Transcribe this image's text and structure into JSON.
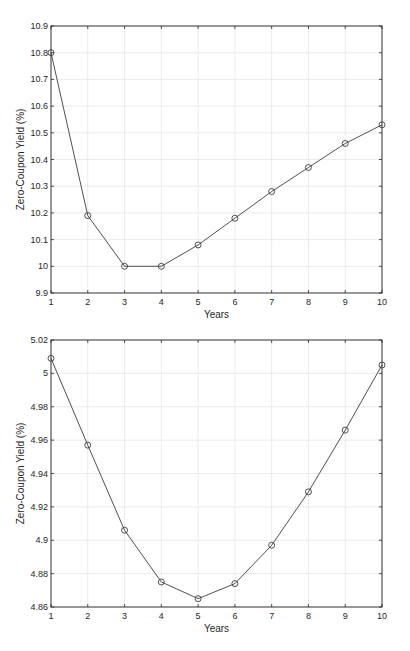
{
  "chart_data": [
    {
      "type": "line",
      "title": "",
      "xlabel": "Years",
      "ylabel": "Zero-Coupon Yield (%)",
      "x": [
        1,
        2,
        3,
        4,
        5,
        6,
        7,
        8,
        9,
        10
      ],
      "series": [
        {
          "name": "Zero-Coupon Yield",
          "values": [
            10.8,
            10.19,
            10.0,
            10.0,
            10.08,
            10.18,
            10.28,
            10.37,
            10.46,
            10.53
          ],
          "marker": "circle",
          "color": "#3c3c3c"
        }
      ],
      "xlim": [
        1,
        10
      ],
      "ylim": [
        9.9,
        10.9
      ],
      "xticks": [
        "1",
        "2",
        "3",
        "4",
        "5",
        "6",
        "7",
        "8",
        "9",
        "10"
      ],
      "yticks": [
        "9.9",
        "10",
        "10.1",
        "10.2",
        "10.3",
        "10.4",
        "10.5",
        "10.6",
        "10.7",
        "10.8",
        "10.9"
      ],
      "grid": true,
      "legend": "none"
    },
    {
      "type": "line",
      "title": "",
      "xlabel": "Years",
      "ylabel": "Zero-Coupon Yield (%)",
      "x": [
        1,
        2,
        3,
        4,
        5,
        6,
        7,
        8,
        9,
        10
      ],
      "series": [
        {
          "name": "Zero-Coupon Yield",
          "values": [
            5.009,
            4.957,
            4.906,
            4.875,
            4.865,
            4.874,
            4.897,
            4.929,
            4.966,
            5.005
          ],
          "marker": "circle",
          "color": "#3c3c3c"
        }
      ],
      "xlim": [
        1,
        10
      ],
      "ylim": [
        4.86,
        5.02
      ],
      "xticks": [
        "1",
        "2",
        "3",
        "4",
        "5",
        "6",
        "7",
        "8",
        "9",
        "10"
      ],
      "yticks": [
        "4.86",
        "4.88",
        "4.9",
        "4.92",
        "4.94",
        "4.96",
        "4.98",
        "5",
        "5.02"
      ],
      "grid": true,
      "legend": "none"
    }
  ]
}
